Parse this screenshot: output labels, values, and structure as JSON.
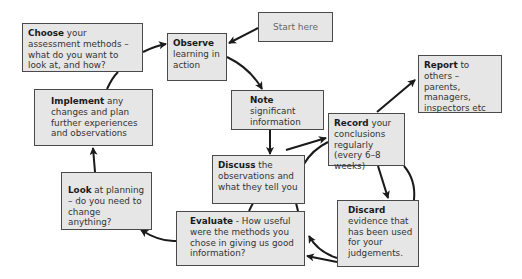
{
  "diagram": {
    "type": "assessment-cycle-flowchart",
    "colors": {
      "box_fill": "#e6e6e6",
      "box_border": "#4a4a4a",
      "arrow": "#1a1a1a",
      "text": "#333333"
    },
    "nodes": {
      "start": {
        "label": "Start here"
      },
      "choose": {
        "bold": "Choose",
        "text": " your assessment methods – what do you want to look at, and how?"
      },
      "observe": {
        "bold": "Observe",
        "text": " learning in action"
      },
      "note": {
        "bold": "Note",
        "text": " significant information"
      },
      "record": {
        "bold": "Record",
        "text": " your conclusions regularly (every 6–8 weeks)"
      },
      "report": {
        "bold": "Report",
        "text": " to others – parents, managers, inspectors etc"
      },
      "discuss": {
        "bold": "Discuss",
        "text": " the observations and what they tell you"
      },
      "discard": {
        "bold": "Discard",
        "text": " evidence that has been used for your judgements."
      },
      "evaluate": {
        "bold": "Evaluate",
        "text": " - How useful were the methods you chose in giving us good information?"
      },
      "look": {
        "bold": "Look",
        "text": " at planning – do you need to change anything?"
      },
      "implement": {
        "bold": "Implement",
        "text": " any changes and plan further experiences and observations"
      }
    },
    "edges": [
      {
        "from": "start",
        "to": "observe"
      },
      {
        "from": "choose",
        "to": "observe"
      },
      {
        "from": "observe",
        "to": "note"
      },
      {
        "from": "note",
        "to": "discuss"
      },
      {
        "from": "discuss",
        "to": "record"
      },
      {
        "from": "record",
        "to": "report"
      },
      {
        "from": "record",
        "to": "discard"
      },
      {
        "from": "discard",
        "to": "evaluate"
      },
      {
        "from": "evaluate",
        "to": "look"
      },
      {
        "from": "look",
        "to": "implement"
      },
      {
        "from": "implement",
        "to": "choose"
      }
    ]
  }
}
